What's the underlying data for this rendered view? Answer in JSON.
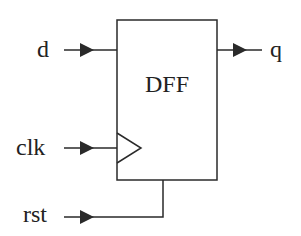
{
  "diagram": {
    "block_label": "DFF",
    "inputs": {
      "d": "d",
      "clk": "clk",
      "rst": "rst"
    },
    "outputs": {
      "q": "q"
    },
    "colors": {
      "stroke": "#2a2a2a",
      "background": "#ffffff"
    }
  }
}
